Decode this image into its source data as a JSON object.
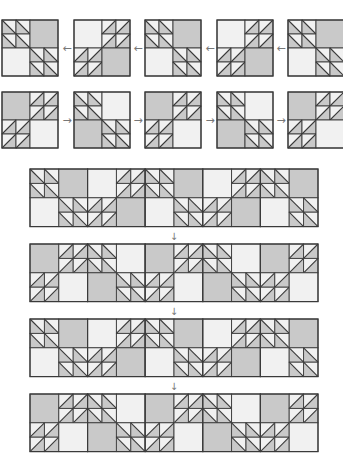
{
  "colors": {
    "gray": "#c9c9c9",
    "light": "#f1f1f1",
    "line": "#3a3a3a",
    "arrow": "#777777"
  },
  "block_types": {
    "A": {
      "tl": "hst-back",
      "tr": "gray",
      "bl": "light",
      "br": "hst-back"
    },
    "B": {
      "tl": "light",
      "tr": "hst-fwd",
      "bl": "hst-fwd",
      "br": "gray"
    },
    "C": {
      "tl": "gray",
      "tr": "hst-fwd",
      "bl": "hst-fwd",
      "br": "light"
    },
    "D": {
      "tl": "hst-back",
      "tr": "light",
      "bl": "gray",
      "br": "hst-back"
    }
  },
  "rows": [
    {
      "y": 20,
      "blocks": [
        "A",
        "B",
        "A",
        "B",
        "A"
      ],
      "xs": [
        2,
        74,
        145,
        217,
        288
      ],
      "arrows": [
        "←",
        "←",
        "←",
        "←"
      ],
      "arrow_xs": [
        67,
        138,
        210,
        281
      ]
    },
    {
      "y": 92,
      "blocks": [
        "C",
        "D",
        "C",
        "D",
        "C"
      ],
      "xs": [
        2,
        74,
        145,
        217,
        288
      ],
      "arrows": [
        "→",
        "→",
        "→",
        "→"
      ],
      "arrow_xs": [
        67,
        138,
        210,
        281
      ]
    }
  ],
  "strips": [
    {
      "y": 169,
      "blocks": [
        "A",
        "B",
        "A",
        "B",
        "A"
      ]
    },
    {
      "y": 244,
      "blocks": [
        "C",
        "D",
        "C",
        "D",
        "C"
      ]
    },
    {
      "y": 319,
      "blocks": [
        "A",
        "B",
        "A",
        "B",
        "A"
      ]
    },
    {
      "y": 394,
      "blocks": [
        "C",
        "D",
        "C",
        "D",
        "C"
      ]
    }
  ],
  "strip_x": 30,
  "strip_cell": 28.8,
  "block_size": 56,
  "down_arrows": [
    {
      "label": "↓",
      "x": 174,
      "y": 240
    },
    {
      "label": "↓",
      "x": 174,
      "y": 315
    },
    {
      "label": "↓",
      "x": 174,
      "y": 390
    }
  ]
}
